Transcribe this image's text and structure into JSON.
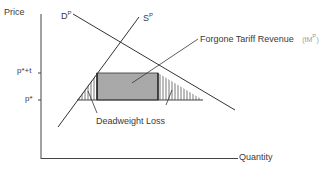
{
  "axes": {
    "y_label": "Price",
    "x_label": "Quantity"
  },
  "curves": {
    "demand": {
      "label": "D",
      "superscript": "P"
    },
    "supply": {
      "label": "S",
      "superscript": "P"
    }
  },
  "price_levels": {
    "tariff_price": "p*+t",
    "world_price": "p*"
  },
  "annotations": {
    "revenue": "Forgone Tariff Revenue",
    "revenue_symbol": "(tM",
    "revenue_symbol_sup": "P",
    "revenue_symbol_close": ")",
    "deadweight": "Deadweight Loss"
  },
  "colors": {
    "line": "#333333",
    "hatch": "#555555",
    "rect_fill": "#cfcfcf"
  }
}
